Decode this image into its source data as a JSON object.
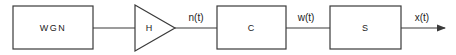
{
  "diagram": {
    "type": "signal-flow-block-diagram",
    "blocks": [
      {
        "id": "wgn",
        "label": "WGN",
        "shape": "rectangle"
      },
      {
        "id": "h",
        "label": "H",
        "shape": "triangle-amplifier"
      },
      {
        "id": "c",
        "label": "C",
        "shape": "rectangle"
      },
      {
        "id": "s",
        "label": "S",
        "shape": "rectangle"
      }
    ],
    "signals": [
      {
        "from": "wgn",
        "to": "h",
        "label": ""
      },
      {
        "from": "h",
        "to": "c",
        "label": "n(t)"
      },
      {
        "from": "c",
        "to": "s",
        "label": "w(t)"
      },
      {
        "from": "s",
        "to": "output",
        "label": "x(t)"
      }
    ],
    "colors": {
      "stroke": "#3a3a3a",
      "text": "#222222",
      "background": "#ffffff"
    }
  }
}
